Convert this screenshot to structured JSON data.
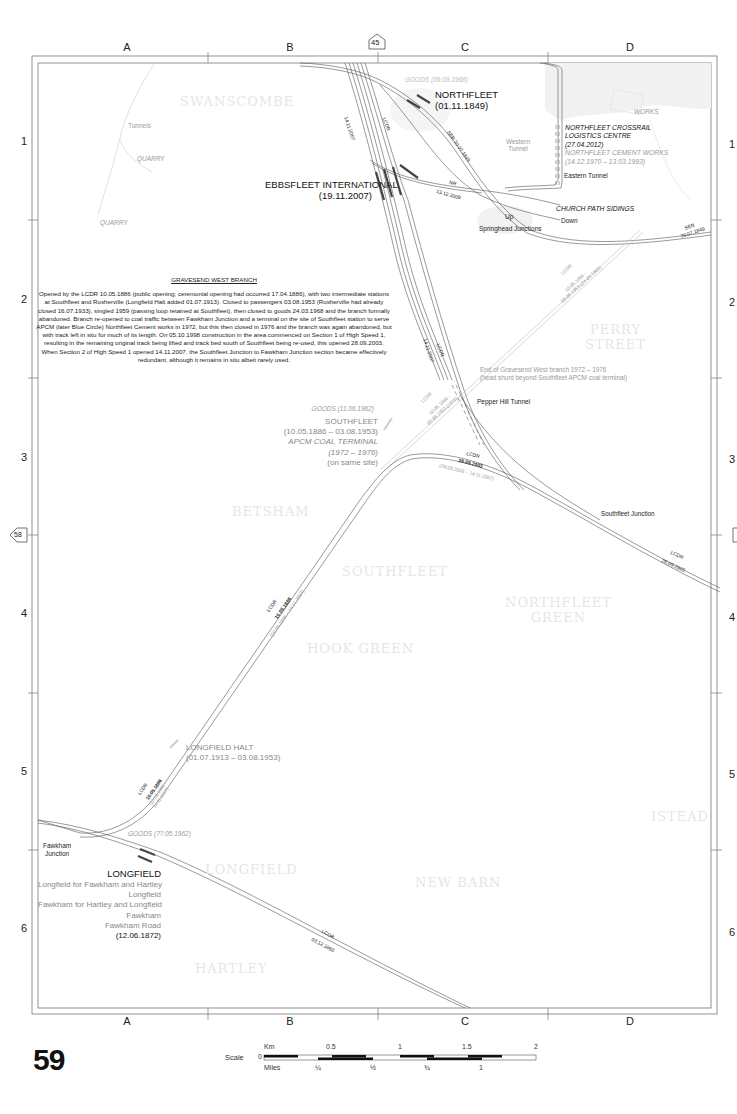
{
  "page": {
    "number": "59",
    "adjacent_pages": {
      "north": "45",
      "west": "58"
    }
  },
  "grid": {
    "columns": [
      "A",
      "B",
      "C",
      "D"
    ],
    "rows": [
      "1",
      "2",
      "3",
      "4",
      "5",
      "6"
    ]
  },
  "places": [
    {
      "name": "SWANSCOMBE"
    },
    {
      "name": "PERRY",
      "name2": "STREET"
    },
    {
      "name": "BETSHAM"
    },
    {
      "name": "SOUTHFLEET"
    },
    {
      "name": "NORTHFLEET",
      "name2": "GREEN"
    },
    {
      "name": "HOOK GREEN"
    },
    {
      "name": "ISTEAD"
    },
    {
      "name": "LONGFIELD"
    },
    {
      "name": "NEW BARN"
    },
    {
      "name": "HARTLEY"
    }
  ],
  "stations": {
    "northfleet": {
      "name": "NORTHFLEET",
      "dates": "(01.11.1849)",
      "goods": "GOODS (09.09.1968)"
    },
    "ebbsfleet": {
      "name": "EBBSFLEET INTERNATIONAL",
      "dates": "(19.11.2007)"
    },
    "southfleet": {
      "goods": "GOODS (11.06.1962)",
      "name": "SOUTHFLEET",
      "dates": "(10.05.1886 – 03.08.1953)",
      "terminal": "APCM COAL TERMINAL",
      "terminal_dates": "(1972 – 1976)",
      "note": "(on same site)"
    },
    "longfield_halt": {
      "name": "LONGFIELD HALT",
      "dates": "(01.07.1913 – 03.08.1953)"
    },
    "longfield": {
      "goods": "GOODS (??.05.1962)",
      "name": "LONGFIELD",
      "former_names": [
        "Longfield for Fawkham and Hartley",
        "Longfield",
        "Fawkham for Hartley and Longfield",
        "Fawkham",
        "Fawkham Road"
      ],
      "dates": "(12.06.1872)"
    }
  },
  "features": {
    "tunnels": "Tunnels",
    "quarry1": "QUARRY",
    "quarry2": "QUARRY",
    "works": "WORKS",
    "western_tunnel": "Western Tunnel",
    "crossrail_line1": "NORTHFLEET CROSSRAIL",
    "crossrail_line2": "LOGISTICS CENTRE",
    "crossrail_date": "(27.04.2012)",
    "cement_works": "NORTHFLEET CEMENT WORKS",
    "cement_dates": "(14.12.1970 – 13.03.1993)",
    "eastern_tunnel": "Eastern Tunnel",
    "church_path": "CHURCH PATH SIDINGS",
    "up": "Up",
    "down": "Down",
    "springhead": "Springhead Junctions",
    "end_branch_1": "End of Gravesend West branch 1972 – 1976",
    "end_branch_2": "(head shunt beyond Southfleet APCM coal terminal)",
    "pepper_hill": "Pepper Hill Tunnel",
    "southfleet_junction": "Southfleet Junction",
    "fawkham_junction_1": "Fawkham",
    "fawkham_junction_2": "Junction"
  },
  "line_labels": {
    "hs1_date": "14.11.2007",
    "lcdr": "LCDR",
    "ser_1849": "SER 30.07.1849",
    "nr": "NR",
    "nr_date": "13.12.2009",
    "ser": "SER",
    "ser_date": "30.07.1849",
    "gw_lcdr": "LCDR",
    "gw_dates_1": "10.05.1886 -",
    "gw_dates_2": "03.08.1953 (24.03.1968)",
    "gw2_dates_1": "10.05.1886 -",
    "gw2_dates_2": "03.08.1953 (1976)",
    "hs1_2003": "28.09.2003",
    "hs1_2003_closed": "(28.09.2003 – 14.11.2007)",
    "sj_lcdr": "LCDR",
    "sj_date": "28.09.2003",
    "main_lcdr": "LCDR",
    "main_date": "10.05.1886",
    "main_closed": "(10.05.1886 – 14.11.2007)",
    "lh_lcdr": "LCDR",
    "lh_date": "10.05.1886",
    "lh_closed_1": "(10.05.1886 –",
    "lh_closed_2": "14.11.2007)",
    "bottom_lcdr": "LCDR",
    "bottom_date": "03.12.1860"
  },
  "note": {
    "title": "GRAVESEND WEST BRANCH",
    "body": "Opened by the LCDR 10.05.1886 (public opening; ceremonial opening had occurred 17.04.1886), with two intermediate stations at Southfleet and Rosherville (Longfield Halt added 01.07.1913). Closed to passengers 03.08.1953 (Rosherville had already closed 16.07.1933), singled 1959 (passing loop retained at Southfleet), then closed to goods 24.03.1968 and the branch formally abandoned. Branch re-opened to coal traffic between Fawkham Junction and a terminal on the site of Southfleet station to serve APCM (later Blue Circle) Northfleet Cement works in 1972, but this then closed in 1976 and the branch was again abandoned, but with track left in situ for much of its length. On 05.10.1998 construction in the area commenced on Section 1 of High Speed 1, resulting in the remaining original track being lifted and track bed south of Southfleet being re-used, this opened 28.09.2003. When Section 2 of High Speed 1 opened 14.11.2007, the Southfleet Junction to Fawkham Junction section became effectively redundant, although it remains in situ albeit rarely used."
  },
  "scale": {
    "label": "Scale",
    "zero": "0",
    "km_label": "Km",
    "km_ticks": [
      "0.5",
      "1",
      "1.5",
      "2"
    ],
    "miles_label": "Miles",
    "mile_ticks": [
      "¼",
      "½",
      "¾",
      "1"
    ]
  },
  "colors": {
    "track": "#555555",
    "track_disused": "#bbbbbb",
    "place": "#e6e6e6",
    "frame": "#666666",
    "station_bar": "#444444"
  }
}
